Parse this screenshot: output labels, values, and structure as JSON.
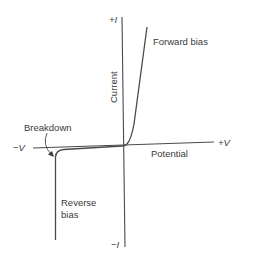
{
  "diagram": {
    "type": "diode I-V characteristic curve",
    "colors": {
      "line": "#4a4a4a",
      "text": "#3a3a3a",
      "background": "#ffffff"
    },
    "axes": {
      "y_positive_label": "+I",
      "y_negative_label": "−I",
      "x_positive_label": "+V",
      "x_negative_label": "−V",
      "y_axis_title": "Current",
      "x_axis_title": "Potential"
    },
    "annotations": {
      "forward": "Forward bias",
      "breakdown": "Breakdown",
      "reverse_line1": "Reverse",
      "reverse_line2": "bias"
    }
  }
}
